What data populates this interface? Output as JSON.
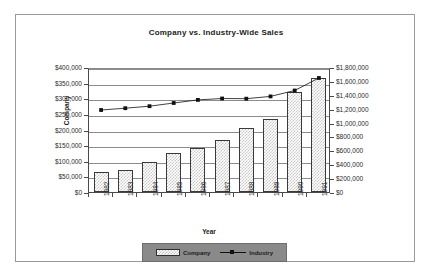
{
  "chart_data": {
    "type": "bar",
    "title": "Company vs. Industry-Wide Sales",
    "xlabel": "Year",
    "ylabel": "Company",
    "categories": [
      "1982",
      "1983",
      "1984",
      "1985",
      "1986",
      "1987",
      "1988",
      "1989",
      "1990",
      "1991"
    ],
    "grid": true,
    "legend_position": "bottom",
    "axes": {
      "left": {
        "label": "Company",
        "ylim": [
          0,
          400000
        ],
        "tick_labels": [
          "$400,000",
          "$350,000",
          "$300,000",
          "$250,000",
          "$200,000",
          "$150,000",
          "$100,000",
          "$50,000",
          "$0"
        ],
        "tick_values": [
          400000,
          350000,
          300000,
          250000,
          200000,
          150000,
          100000,
          50000,
          0
        ]
      },
      "right": {
        "label": "",
        "ylim": [
          0,
          1800000
        ],
        "tick_labels": [
          "$1,800,000",
          "$1,600,000",
          "$1,400,000",
          "$1,200,000",
          "$1,000,000",
          "$800,000",
          "$600,000",
          "$400,000",
          "$200,000",
          "$0"
        ],
        "tick_values": [
          1800000,
          1600000,
          1400000,
          1200000,
          1000000,
          800000,
          600000,
          400000,
          200000,
          0
        ]
      }
    },
    "series": [
      {
        "name": "Company",
        "type": "bar",
        "axis": "left",
        "values": [
          64000,
          70000,
          95000,
          126000,
          140000,
          165000,
          205000,
          235000,
          320000,
          365000
        ]
      },
      {
        "name": "Industry",
        "type": "line",
        "axis": "right",
        "marker": "square",
        "values": [
          1210000,
          1235000,
          1265000,
          1310000,
          1355000,
          1375000,
          1372000,
          1405000,
          1490000,
          1670000
        ]
      }
    ]
  },
  "legend": {
    "entries": [
      {
        "label": "Company"
      },
      {
        "label": "Industry"
      }
    ]
  }
}
